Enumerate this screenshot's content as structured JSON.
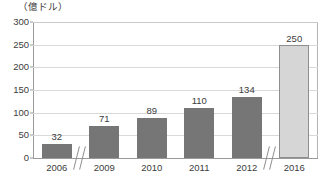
{
  "chart_data": {
    "type": "bar",
    "title": "",
    "subtitle": "",
    "unit_label": "（億ドル）",
    "xlabel": "",
    "ylabel": "",
    "categories": [
      "2006",
      "2009",
      "2010",
      "2011",
      "2012",
      "2016"
    ],
    "values": [
      32,
      71,
      89,
      110,
      134,
      250
    ],
    "value_labels": [
      "32",
      "71",
      "89",
      "110",
      "134",
      "250"
    ],
    "ylim": [
      0,
      300
    ],
    "y_ticks": [
      0,
      50,
      100,
      150,
      200,
      250,
      300
    ],
    "y_tick_labels": [
      "0",
      "50",
      "100",
      "150",
      "200",
      "250",
      "300"
    ],
    "grid": true,
    "legend": "none",
    "series": [
      {
        "name": "",
        "values": [
          32,
          71,
          89,
          110,
          134,
          250
        ]
      }
    ],
    "bar_colors": [
      "#767676",
      "#767676",
      "#767676",
      "#767676",
      "#767676",
      "#d6d6d6"
    ],
    "highlight_index": 5,
    "axis_breaks": [
      {
        "after_category": "2006",
        "note": "axis break between 2006 and 2009"
      },
      {
        "after_category": "2012",
        "note": "axis break between 2012 and 2016"
      }
    ],
    "colors": {
      "bar_default": "#767676",
      "bar_highlight": "#d6d6d6",
      "bar_highlight_border": "#8e8e8e",
      "gridline": "#d9d9d9",
      "axis": "#9a9a9a",
      "text": "#3c3c3c",
      "background": "#ffffff"
    }
  }
}
